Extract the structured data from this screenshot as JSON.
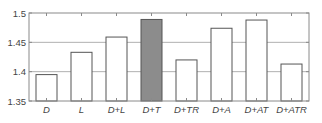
{
  "chart_data": {
    "type": "bar",
    "title": "",
    "xlabel": "",
    "ylabel": "",
    "categories": [
      "D",
      "L",
      "D+L",
      "D+T",
      "D+TR",
      "D+A",
      "D+AT",
      "D+ATR"
    ],
    "values": [
      1.395,
      1.433,
      1.459,
      1.489,
      1.42,
      1.474,
      1.488,
      1.413
    ],
    "highlighted_index": 3,
    "ylim": [
      1.35,
      1.5
    ],
    "yticks": [
      1.35,
      1.4,
      1.45,
      1.5
    ],
    "ytick_labels": [
      "1.35",
      "1.4",
      "1.45",
      "1.5"
    ],
    "grid": true,
    "legend": null,
    "colors": {
      "bar_fill": "#ffffff",
      "bar_highlight_fill": "#8c8c8c",
      "bar_edge": "#555555",
      "grid": "#b0b0b0",
      "axis": "#8a8a8a"
    }
  }
}
